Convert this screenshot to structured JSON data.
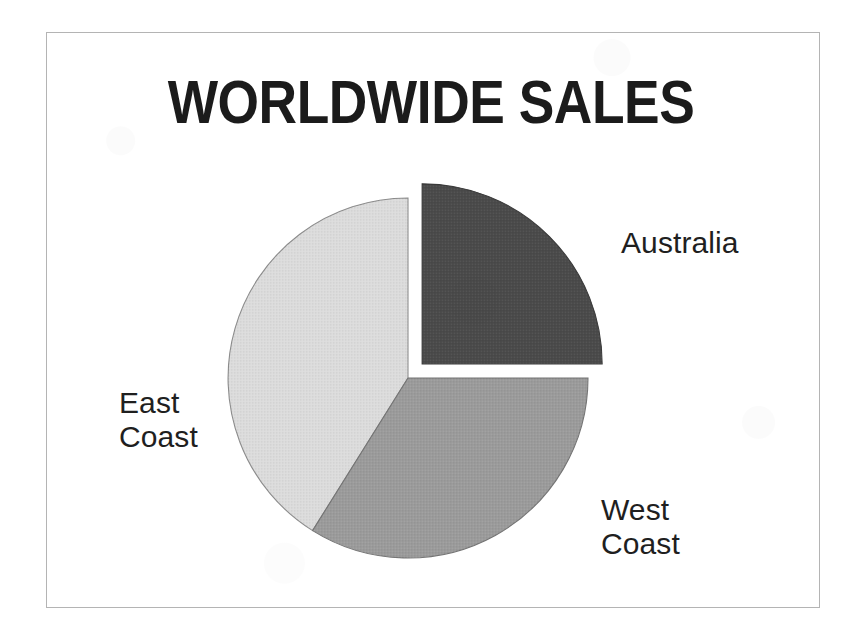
{
  "figure": {
    "title": "WORLDWIDE SALES",
    "frame": {
      "border_color": "#b4b4b4"
    },
    "background_color": "#ffffff"
  },
  "chart_data": {
    "type": "pie",
    "title": "WORLDWIDE SALES",
    "xlabel": "",
    "ylabel": "",
    "legend_position": "none",
    "labels_position": "outside-callout",
    "grid": false,
    "start_angle_deg": 0,
    "direction": "clockwise",
    "categories": [
      "Australia",
      "West Coast",
      "East Coast"
    ],
    "values": [
      25,
      34,
      41
    ],
    "value_unit": "percent",
    "slices": [
      {
        "label": "Australia",
        "value": 25,
        "start_angle_deg": 0,
        "end_angle_deg": 90,
        "color": "#4a4a4a",
        "exploded": true,
        "explode_offset_px": 20
      },
      {
        "label": "West Coast",
        "value": 34,
        "start_angle_deg": 90,
        "end_angle_deg": 212,
        "color": "#9b9b9b",
        "exploded": false,
        "explode_offset_px": 0
      },
      {
        "label": "East Coast",
        "value": 41,
        "start_angle_deg": 212,
        "end_angle_deg": 360,
        "color": "#dcdcdc",
        "exploded": false,
        "explode_offset_px": 0
      }
    ]
  },
  "labels": {
    "australia": "Australia",
    "west_coast": "West\nCoast",
    "east_coast": "East\nCoast"
  },
  "colors": {
    "australia_slice": "#4a4a4a",
    "west_coast_slice": "#9b9b9b",
    "east_coast_slice": "#dcdcdc",
    "slice_outline": "#6e6e6e",
    "title_text": "#1b1b1b",
    "label_text": "#1f1f1f",
    "frame_border": "#b4b4b4",
    "page_background": "#ffffff"
  }
}
